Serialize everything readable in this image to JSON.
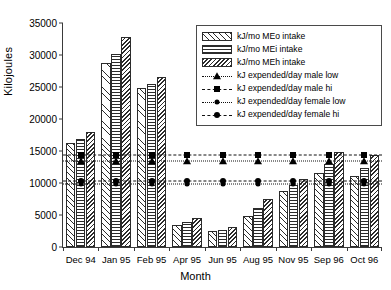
{
  "chart_data": {
    "type": "bar",
    "title": "",
    "xlabel": "Month",
    "ylabel": "Kilojoules",
    "ylim": [
      0,
      35000
    ],
    "ytick_step": 5000,
    "yticks": [
      "0",
      "5000",
      "10000",
      "15000",
      "20000",
      "25000",
      "30000",
      "35000"
    ],
    "grid": false,
    "legend_position": "top-right",
    "categories": [
      "Dec 94",
      "Jan 95",
      "Feb 95",
      "Apr 95",
      "Jun 95",
      "Aug 95",
      "Nov 95",
      "Sep 96",
      "Oct 96"
    ],
    "series": [
      {
        "name": "kJ/mo MEo intake",
        "pattern": "diagonal-sparse",
        "values": [
          16200,
          28700,
          24900,
          3400,
          2500,
          4800,
          8700,
          11500,
          11100
        ]
      },
      {
        "name": "kJ/mo MEi intake",
        "pattern": "horizontal-lines",
        "values": [
          16900,
          30100,
          25500,
          3900,
          2700,
          6100,
          9700,
          13000,
          12400
        ]
      },
      {
        "name": "kJ/mo MEh intake",
        "pattern": "diagonal-dense",
        "values": [
          18000,
          32800,
          26600,
          4600,
          3200,
          7500,
          10700,
          14900,
          14300
        ]
      }
    ],
    "reference_lines": [
      {
        "name": "kJ expended/day male low",
        "value": 13500,
        "marker": "triangle",
        "dash": "dotted"
      },
      {
        "name": "kJ expended/day male hi",
        "value": 14400,
        "marker": "square",
        "dash": "dashed"
      },
      {
        "name": "kJ expended/day female low",
        "value": 9800,
        "marker": "small-circle",
        "dash": "dotted"
      },
      {
        "name": "kJ expended/day female hi",
        "value": 10300,
        "marker": "circle",
        "dash": "dashed"
      }
    ]
  },
  "legend": {
    "items": [
      {
        "label": "kJ/mo MEo intake",
        "kind": "bar",
        "pattern": "diagonal-sparse"
      },
      {
        "label": "kJ/mo MEi intake",
        "kind": "bar",
        "pattern": "horizontal-lines"
      },
      {
        "label": "kJ/mo MEh intake",
        "kind": "bar",
        "pattern": "diagonal-dense"
      },
      {
        "label": "kJ expended/day male low",
        "kind": "line",
        "marker": "triangle",
        "dash": "dotted"
      },
      {
        "label": "kJ expended/day male hi",
        "kind": "line",
        "marker": "square",
        "dash": "dashed"
      },
      {
        "label": "kJ expended/day female low",
        "kind": "line",
        "marker": "small-circle",
        "dash": "dotted"
      },
      {
        "label": "kJ expended/day female hi",
        "kind": "line",
        "marker": "circle",
        "dash": "dashed"
      }
    ]
  },
  "colors": {
    "ink": "#000000",
    "axis": "#3a3a3a",
    "background": "#ffffff"
  }
}
